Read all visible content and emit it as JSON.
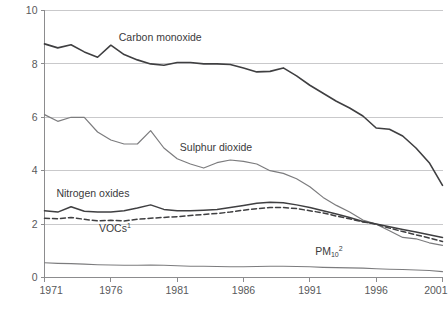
{
  "chart_data": {
    "type": "line",
    "title": "",
    "subtitle": "",
    "xlabel": "",
    "ylabel": "",
    "xlim": [
      1971,
      2001
    ],
    "ylim": [
      0,
      10
    ],
    "grid": "horizontal",
    "legend": "inline-labels",
    "x_ticks": [
      "1971",
      "1976",
      "1981",
      "1986",
      "1991",
      "1996",
      "2001"
    ],
    "x_tick_values": [
      1971,
      1976,
      1981,
      1986,
      1991,
      1996,
      2001
    ],
    "y_ticks": [
      "0",
      "2",
      "4",
      "6",
      "8",
      "10"
    ],
    "y_tick_values": [
      0,
      2,
      4,
      6,
      8,
      10
    ],
    "x": [
      1971,
      1972,
      1973,
      1974,
      1975,
      1976,
      1977,
      1978,
      1979,
      1980,
      1981,
      1982,
      1983,
      1984,
      1985,
      1986,
      1987,
      1988,
      1989,
      1990,
      1991,
      1992,
      1993,
      1994,
      1995,
      1996,
      1997,
      1998,
      1999,
      2000,
      2001
    ],
    "series": [
      {
        "name": "Carbon monoxide",
        "label": "Carbon monoxide",
        "label_x": 1976.6,
        "label_y": 8.85,
        "color": "#3f3f41",
        "width": 1.6,
        "dash": "none",
        "values": [
          8.75,
          8.6,
          8.72,
          8.45,
          8.25,
          8.7,
          8.35,
          8.15,
          8.0,
          7.95,
          8.05,
          8.05,
          8.0,
          8.0,
          7.98,
          7.85,
          7.7,
          7.72,
          7.85,
          7.55,
          7.2,
          6.9,
          6.6,
          6.35,
          6.05,
          5.6,
          5.55,
          5.3,
          4.85,
          4.3,
          3.45
        ]
      },
      {
        "name": "Sulphur dioxide",
        "label": "Sulphur dioxide",
        "label_x": 1981.2,
        "label_y": 4.72,
        "color": "#7c7c7e",
        "width": 1.2,
        "dash": "none",
        "values": [
          6.1,
          5.85,
          6.0,
          6.0,
          5.45,
          5.15,
          5.0,
          5.0,
          5.5,
          4.85,
          4.45,
          4.25,
          4.1,
          4.3,
          4.4,
          4.35,
          4.25,
          4.0,
          3.9,
          3.7,
          3.4,
          3.0,
          2.7,
          2.45,
          2.15,
          2.0,
          1.75,
          1.5,
          1.45,
          1.3,
          1.2
        ]
      },
      {
        "name": "Nitrogen oxides",
        "label": "Nitrogen oxides",
        "label_x": 1971.9,
        "label_y": 3.02,
        "color": "#3f3f41",
        "width": 1.5,
        "dash": "none",
        "values": [
          2.5,
          2.45,
          2.65,
          2.48,
          2.45,
          2.45,
          2.5,
          2.6,
          2.72,
          2.55,
          2.5,
          2.5,
          2.52,
          2.55,
          2.62,
          2.7,
          2.78,
          2.82,
          2.8,
          2.72,
          2.62,
          2.5,
          2.38,
          2.25,
          2.1,
          2.0,
          1.9,
          1.8,
          1.7,
          1.6,
          1.5
        ]
      },
      {
        "name": "VOCs",
        "label": "VOCs",
        "label_sup": "1",
        "label_x": 1975.1,
        "label_y": 1.72,
        "color": "#3f3f41",
        "width": 1.5,
        "dash": "5 3",
        "values": [
          2.22,
          2.2,
          2.25,
          2.18,
          2.12,
          2.14,
          2.12,
          2.18,
          2.22,
          2.25,
          2.28,
          2.32,
          2.36,
          2.4,
          2.45,
          2.52,
          2.58,
          2.62,
          2.62,
          2.58,
          2.5,
          2.42,
          2.3,
          2.2,
          2.08,
          2.0,
          1.85,
          1.72,
          1.6,
          1.48,
          1.35
        ]
      },
      {
        "name": "PM10",
        "label": "PM",
        "label_sub": "10",
        "label_sup": "2",
        "label_x": 1991.4,
        "label_y": 0.86,
        "color": "#7c7c7e",
        "width": 1.1,
        "dash": "none",
        "values": [
          0.55,
          0.53,
          0.52,
          0.5,
          0.48,
          0.47,
          0.46,
          0.46,
          0.47,
          0.46,
          0.44,
          0.42,
          0.42,
          0.41,
          0.4,
          0.4,
          0.41,
          0.42,
          0.42,
          0.41,
          0.4,
          0.38,
          0.37,
          0.36,
          0.35,
          0.33,
          0.31,
          0.3,
          0.28,
          0.26,
          0.22
        ]
      }
    ]
  },
  "colors": {
    "background": "#ffffff",
    "axis": "#8c8c8e",
    "grid": "#c9c9cb",
    "tick_text": "#58595b",
    "label_text": "#3a3a3c"
  }
}
